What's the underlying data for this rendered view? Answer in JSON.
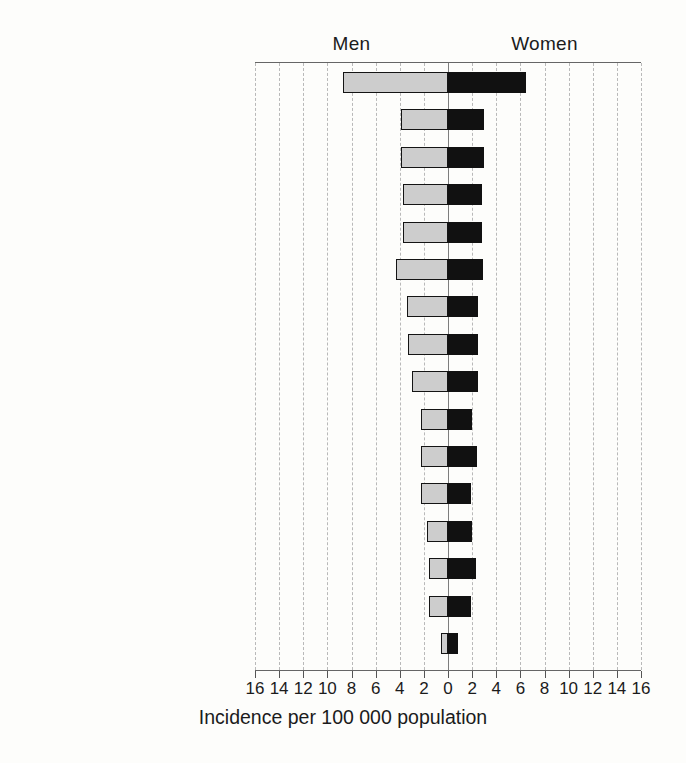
{
  "chart_data": {
    "type": "bar",
    "orientation": "horizontal-diverging",
    "title": "",
    "xlabel": "Incidence per 100 000 population",
    "ylabel": "",
    "grid": true,
    "legend_position": "top",
    "axis": {
      "tick_labels": [
        "16",
        "14",
        "12",
        "10",
        "8",
        "6",
        "4",
        "2",
        "0",
        "2",
        "4",
        "6",
        "8",
        "10",
        "12",
        "14",
        "16"
      ],
      "tick_values": [
        -16,
        -14,
        -12,
        -10,
        -8,
        -6,
        -4,
        -2,
        0,
        2,
        4,
        6,
        8,
        10,
        12,
        14,
        16
      ],
      "xlim": [
        -16,
        16
      ],
      "left_side_label": "Men",
      "right_side_label": "Women"
    },
    "categories": [
      "US, SEER: Black",
      "New Zealand",
      "Canada",
      "US, SEER: White",
      "Norway",
      "Finland",
      "England and Wales",
      "The Netherlands",
      "Denmark",
      "Czech Republic",
      "Germany, Saarland",
      "Israel: Jews",
      "Poland, Warsaw City",
      "Japan, Hiroshima",
      "Hong Kong",
      "India, Madras"
    ],
    "series": [
      {
        "name": "Men",
        "side": "left",
        "color": "#cdcdcd",
        "values": [
          8.7,
          3.9,
          3.9,
          3.7,
          3.7,
          4.3,
          3.4,
          3.3,
          3.0,
          2.2,
          2.2,
          2.2,
          1.7,
          1.6,
          1.6,
          0.6
        ]
      },
      {
        "name": "Women",
        "side": "right",
        "color": "#111111",
        "values": [
          6.5,
          3.0,
          3.0,
          2.8,
          2.8,
          2.9,
          2.5,
          2.5,
          2.5,
          2.0,
          2.4,
          1.9,
          2.0,
          2.3,
          1.9,
          0.8
        ]
      }
    ]
  }
}
